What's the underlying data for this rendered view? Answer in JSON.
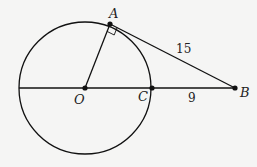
{
  "diagram": {
    "type": "geometry",
    "colors": {
      "background": "#f5f5f4",
      "stroke": "#111111"
    },
    "circle": {
      "center_label": "O",
      "cx": 85,
      "cy": 88,
      "r": 66
    },
    "points": [
      {
        "label": "A",
        "x": 110,
        "y": 24
      },
      {
        "label": "O",
        "x": 85,
        "y": 88
      },
      {
        "label": "C",
        "x": 152,
        "y": 88
      },
      {
        "label": "B",
        "x": 235,
        "y": 88
      }
    ],
    "segments": [
      {
        "from": "O",
        "to": "A"
      },
      {
        "from": "A",
        "to": "B",
        "length_label": "15"
      },
      {
        "from": "left-edge",
        "to": "B"
      },
      {
        "from": "C",
        "to": "B",
        "length_label": "9"
      }
    ],
    "right_angle_at": "A",
    "labels": {
      "A": "A",
      "O": "O",
      "C": "C",
      "B": "B",
      "AB_length": "15",
      "CB_length": "9"
    }
  }
}
